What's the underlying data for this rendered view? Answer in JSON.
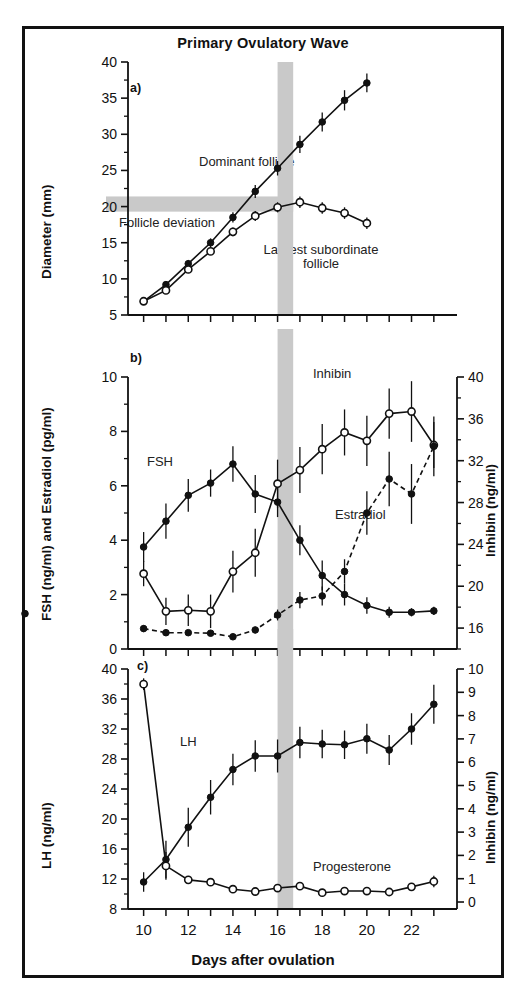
{
  "figure": {
    "title": "Primary Ovulatory Wave",
    "xlabel": "Days after ovulation",
    "panels": [
      "a)",
      "b)",
      "c)"
    ],
    "deviation_label": "Follicle deviation",
    "band_days": [
      16,
      16.7
    ]
  },
  "panel_a": {
    "letter": "a)",
    "ylabel": "Diameter (mm)",
    "yticks": [
      "5",
      "10",
      "15",
      "20",
      "25",
      "30",
      "35",
      "40"
    ],
    "labels": {
      "dominant": "Dominant follicle",
      "subordinate_line1": "Largest subordinate",
      "subordinate_line2": "follicle",
      "deviation": "Follicle deviation"
    }
  },
  "panel_b": {
    "letter": "b)",
    "ylabel": "FSH (ng/ml) and Estradiol (pg/ml)",
    "ylabel_right": "Inhibin (ng/ml)",
    "yticks": [
      "0",
      "2",
      "4",
      "6",
      "8",
      "10"
    ],
    "yticks_right": [
      "16",
      "20",
      "24",
      "28",
      "32",
      "36",
      "40"
    ],
    "labels": {
      "fsh": "FSH",
      "inhibin": "Inhibin",
      "estradiol": "Estradiol"
    }
  },
  "panel_c": {
    "letter": "c)",
    "ylabel": "LH (ng/ml)",
    "ylabel_right": "Inhibin (ng/ml)",
    "yticks": [
      "8",
      "12",
      "16",
      "20",
      "24",
      "28",
      "32",
      "36",
      "40"
    ],
    "yticks_right": [
      "0",
      "1",
      "2",
      "3",
      "4",
      "5",
      "6",
      "7",
      "8",
      "9",
      "10"
    ],
    "labels": {
      "lh": "LH",
      "progesterone": "Progesterone"
    }
  },
  "xticks": [
    "10",
    "12",
    "14",
    "16",
    "18",
    "20",
    "22"
  ],
  "chart_data": [
    {
      "type": "line",
      "panel": "a",
      "title": "Primary Ovulatory Wave",
      "xlabel": "Days after ovulation",
      "ylabel": "Diameter (mm)",
      "ylim": [
        5,
        40
      ],
      "xlim": [
        9.3,
        23.5
      ],
      "grid": false,
      "x": [
        10,
        11,
        12,
        13,
        14,
        15,
        16,
        17,
        18,
        19,
        20,
        21,
        22,
        23
      ],
      "series": [
        {
          "name": "Dominant follicle",
          "marker": "filled-circle",
          "line": "solid",
          "values": [
            6.9,
            9.2,
            12.1,
            15.0,
            18.5,
            22.1,
            25.3,
            28.6,
            31.7,
            34.7,
            37.1
          ],
          "x": [
            10,
            11,
            12,
            13,
            14,
            15,
            16,
            17,
            18,
            19,
            20
          ],
          "errors": [
            0.3,
            0.4,
            0.5,
            0.6,
            0.7,
            0.9,
            1.0,
            1.2,
            1.3,
            1.4,
            1.3
          ]
        },
        {
          "name": "Largest subordinate follicle",
          "marker": "open-circle",
          "line": "solid",
          "values": [
            6.9,
            8.4,
            11.3,
            13.8,
            16.5,
            18.7,
            19.9,
            20.6,
            19.8,
            19.1,
            17.7
          ],
          "x": [
            10,
            11,
            12,
            13,
            14,
            15,
            16,
            17,
            18,
            19,
            20
          ],
          "errors": [
            0.3,
            0.4,
            0.5,
            0.5,
            0.6,
            0.7,
            0.7,
            0.8,
            0.8,
            0.8,
            0.8
          ]
        }
      ]
    },
    {
      "type": "line",
      "panel": "b",
      "xlabel": "Days after ovulation",
      "ylabel": "FSH (ng/ml) and Estradiol (pg/ml)",
      "ylabel_right": "Inhibin (ng/ml)",
      "ylim": [
        0,
        10
      ],
      "ylim_right": [
        14,
        40
      ],
      "xlim": [
        9.3,
        23.5
      ],
      "grid": false,
      "x": [
        10,
        11,
        12,
        13,
        14,
        15,
        16,
        17,
        18,
        19,
        20,
        21,
        22,
        23
      ],
      "series": [
        {
          "name": "FSH",
          "axis": "left",
          "marker": "filled-circle",
          "line": "solid",
          "values": [
            3.75,
            4.7,
            5.65,
            6.1,
            6.8,
            5.7,
            5.4,
            4.0,
            2.7,
            2.0,
            1.6,
            1.35,
            1.35,
            1.4,
            1.3
          ],
          "errors": [
            0.55,
            0.65,
            0.6,
            0.5,
            0.65,
            0.7,
            0.55,
            0.55,
            0.55,
            0.4,
            0.3,
            0.2,
            0.15,
            0.15,
            0.12
          ]
        },
        {
          "name": "Inhibin",
          "axis": "right",
          "marker": "open-circle",
          "line": "solid",
          "values": [
            21.2,
            17.6,
            17.7,
            17.6,
            21.4,
            23.2,
            29.8,
            31.1,
            33.1,
            34.7,
            33.9,
            36.5,
            36.7,
            33.5
          ],
          "errors": [
            1.2,
            1.3,
            1.5,
            1.6,
            2.0,
            2.3,
            2.3,
            2.2,
            2.4,
            2.2,
            2.4,
            2.4,
            2.9,
            2.2
          ]
        },
        {
          "name": "Estradiol",
          "axis": "left",
          "marker": "filled-circle",
          "line": "dashed",
          "values": [
            0.75,
            0.6,
            0.6,
            0.58,
            0.45,
            0.7,
            1.25,
            1.8,
            1.95,
            2.85,
            5.0,
            6.25,
            5.7,
            7.45
          ],
          "errors": [
            0.12,
            0.1,
            0.1,
            0.1,
            0.1,
            0.12,
            0.2,
            0.3,
            0.35,
            0.45,
            0.8,
            1.0,
            1.1,
            1.1
          ]
        }
      ]
    },
    {
      "type": "line",
      "panel": "c",
      "xlabel": "Days after ovulation",
      "ylabel": "LH (ng/ml)",
      "ylabel_right": "Inhibin (ng/ml)",
      "ylim": [
        8,
        40
      ],
      "ylim_right": [
        -0.3,
        10
      ],
      "xlim": [
        9.3,
        23.5
      ],
      "grid": false,
      "x": [
        10,
        11,
        12,
        13,
        14,
        15,
        16,
        17,
        18,
        19,
        20,
        21,
        22,
        23
      ],
      "series": [
        {
          "name": "LH",
          "axis": "left",
          "marker": "filled-circle",
          "line": "solid",
          "values": [
            11.6,
            14.6,
            18.9,
            22.9,
            26.6,
            28.4,
            28.4,
            30.2,
            30.0,
            29.9,
            30.7,
            29.2,
            32.0,
            35.3
          ],
          "errors": [
            1.3,
            2.5,
            2.6,
            2.3,
            2.1,
            2.1,
            2.2,
            2.1,
            1.9,
            1.9,
            2.0,
            2.0,
            2.1,
            2.6
          ]
        },
        {
          "name": "Progesterone",
          "axis": "right",
          "marker": "open-circle",
          "line": "solid",
          "values": [
            9.35,
            1.55,
            0.95,
            0.85,
            0.55,
            0.45,
            0.6,
            0.68,
            0.4,
            0.47,
            0.47,
            0.43,
            0.65,
            0.88
          ],
          "errors": [
            0.25,
            0.6,
            0.1,
            0.1,
            0.08,
            0.08,
            0.08,
            0.08,
            0.08,
            0.08,
            0.08,
            0.08,
            0.12,
            0.25
          ]
        }
      ]
    }
  ]
}
